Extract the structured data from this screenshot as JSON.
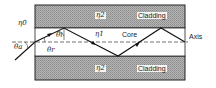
{
  "diagram": {
    "regions": {
      "top_cladding": {
        "label": "Cladding",
        "index": "η2"
      },
      "core": {
        "label": "Core",
        "index": "η1"
      },
      "bottom_cladding": {
        "label": "Cladding",
        "index": "η2"
      },
      "outside": {
        "index": "η0"
      }
    },
    "axis_label": "Axis",
    "angles": {
      "incident": "θa",
      "refracted": "θr",
      "reflection": "θi"
    },
    "colors": {
      "cladding": "#a8a8a8",
      "core": "#ffffff",
      "line": "#1a1a1a",
      "background": "#ffffff"
    }
  }
}
